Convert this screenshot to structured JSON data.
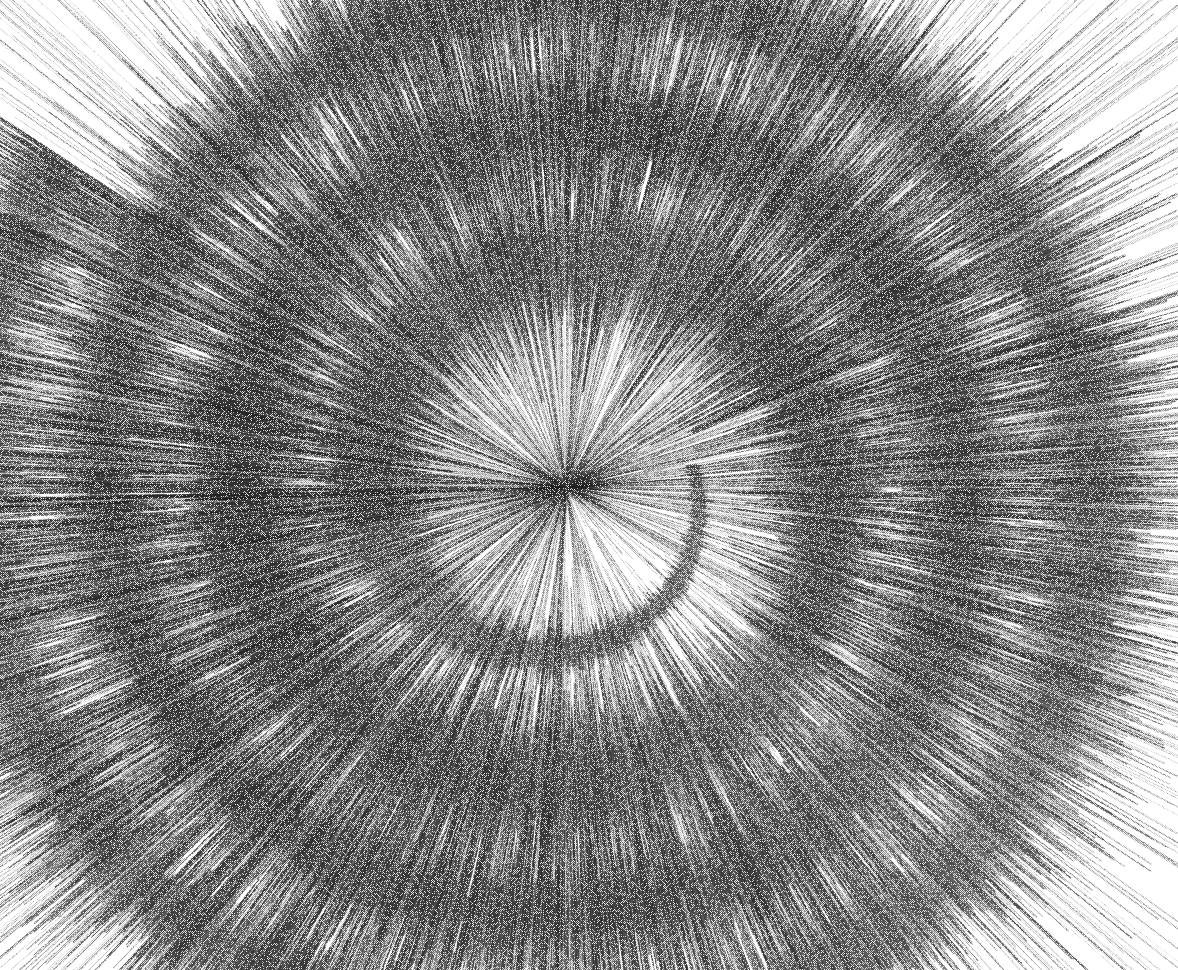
{
  "figure": {
    "title": "Spiral Audio Waveform",
    "subtitle": "",
    "background_color": "#ffffff",
    "width": 1178,
    "height": 970
  },
  "chart_data": {
    "type": "line",
    "render": "spiral-waveform",
    "title": "Spiral Audio Waveform",
    "subtitle": "",
    "xlabel": "",
    "ylabel": "",
    "legend": [],
    "grid": false,
    "axes_visible": false,
    "tick_labels": [],
    "annotations": [],
    "geometry": {
      "center_x": 566,
      "center_y": 487,
      "start_angle_deg": -10,
      "turns": 3.62,
      "r_start": 128,
      "r_growth_per_turn": 132,
      "direction": "clockwise",
      "amplitude_base": 4,
      "amplitude_growth": 0.52,
      "amplitude_max": 180,
      "samples": 26000
    },
    "palette": {
      "ink_darkest": "#2e2e2e",
      "ink_dark": "#4a4a4a",
      "ink_mid": "#7a7a7a",
      "ink_light": "#a8a8a8",
      "ink_lightest": "#cdcdcd",
      "paper": "#ffffff"
    },
    "texture": {
      "style": "halftone-dither",
      "dot_pitch": 2,
      "noise": 0.34
    },
    "envelope_notes": [
      {
        "angle_deg": 0,
        "radius": 128,
        "amplitude": 6,
        "shade": "#8a8a8a"
      },
      {
        "angle_deg": 45,
        "radius": 145,
        "amplitude": 9,
        "shade": "#6f6f6f"
      },
      {
        "angle_deg": 90,
        "radius": 161,
        "amplitude": 12,
        "shade": "#777777"
      },
      {
        "angle_deg": 135,
        "radius": 178,
        "amplitude": 10,
        "shade": "#9a9a9a"
      },
      {
        "angle_deg": 180,
        "radius": 194,
        "amplitude": 14,
        "shade": "#5f5f5f"
      },
      {
        "angle_deg": 225,
        "radius": 211,
        "amplitude": 18,
        "shade": "#6a6a6a"
      },
      {
        "angle_deg": 270,
        "radius": 227,
        "amplitude": 22,
        "shade": "#828282"
      },
      {
        "angle_deg": 315,
        "radius": 244,
        "amplitude": 26,
        "shade": "#545454"
      },
      {
        "angle_deg": 360,
        "radius": 260,
        "amplitude": 34,
        "shade": "#4f4f4f"
      },
      {
        "angle_deg": 405,
        "radius": 277,
        "amplitude": 41,
        "shade": "#707070"
      },
      {
        "angle_deg": 450,
        "radius": 293,
        "amplitude": 48,
        "shade": "#5a5a5a"
      },
      {
        "angle_deg": 495,
        "radius": 310,
        "amplitude": 55,
        "shade": "#8d8d8d"
      },
      {
        "angle_deg": 540,
        "radius": 326,
        "amplitude": 63,
        "shade": "#4d4d4d"
      },
      {
        "angle_deg": 585,
        "radius": 343,
        "amplitude": 72,
        "shade": "#6b6b6b"
      },
      {
        "angle_deg": 630,
        "radius": 359,
        "amplitude": 84,
        "shade": "#5c5c5c"
      },
      {
        "angle_deg": 675,
        "radius": 376,
        "amplitude": 97,
        "shade": "#909090"
      },
      {
        "angle_deg": 720,
        "radius": 392,
        "amplitude": 110,
        "shade": "#484848"
      },
      {
        "angle_deg": 765,
        "radius": 409,
        "amplitude": 126,
        "shade": "#646464"
      },
      {
        "angle_deg": 810,
        "radius": 425,
        "amplitude": 142,
        "shade": "#7d7d7d"
      },
      {
        "angle_deg": 855,
        "radius": 442,
        "amplitude": 158,
        "shade": "#565656"
      },
      {
        "angle_deg": 900,
        "radius": 458,
        "amplitude": 170,
        "shade": "#6e6e6e"
      }
    ],
    "burst_segments": [
      {
        "name": "upper-left-heavy",
        "angle_deg": 152,
        "amplitude": 160,
        "shade": "#3c3c3c"
      },
      {
        "name": "left-long-spike",
        "angle_deg": 186,
        "amplitude": 185,
        "shade": "#575757"
      },
      {
        "name": "lower-left-fan",
        "angle_deg": 214,
        "amplitude": 178,
        "shade": "#6c6c6c"
      },
      {
        "name": "bottom-dense",
        "angle_deg": 268,
        "amplitude": 172,
        "shade": "#4a4a4a"
      },
      {
        "name": "lower-right-fan",
        "angle_deg": 312,
        "amplitude": 150,
        "shade": "#5e5e5e"
      },
      {
        "name": "right-tail-burst",
        "angle_deg": 357,
        "amplitude": 120,
        "shade": "#8b8b8b"
      },
      {
        "name": "top-crest",
        "angle_deg": 96,
        "amplitude": 130,
        "shade": "#505050"
      }
    ]
  }
}
